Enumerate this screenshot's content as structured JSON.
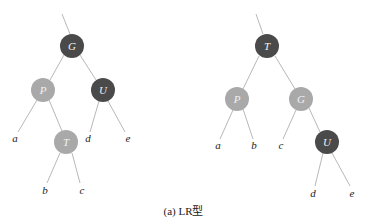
{
  "caption": "(a) LR型",
  "colors": {
    "black_node": "#4a4a4a",
    "red_node": "#a9a9a9",
    "edge": "#b8b8b8",
    "leaf_text": "#222222"
  },
  "left_tree": {
    "title": "before rotation",
    "nodes": [
      {
        "id": "G",
        "label": "G",
        "color": "black",
        "x": 72,
        "y": 46
      },
      {
        "id": "P",
        "label": "P",
        "color": "red",
        "x": 43,
        "y": 90
      },
      {
        "id": "U",
        "label": "U",
        "color": "black",
        "x": 103,
        "y": 90
      },
      {
        "id": "T",
        "label": "T",
        "color": "red",
        "x": 66,
        "y": 142
      }
    ],
    "leaves": [
      {
        "label": "a",
        "x": 15,
        "y": 138
      },
      {
        "label": "d",
        "x": 88,
        "y": 138
      },
      {
        "label": "e",
        "x": 128,
        "y": 138
      },
      {
        "label": "b",
        "x": 45,
        "y": 190
      },
      {
        "label": "c",
        "x": 82,
        "y": 190
      }
    ]
  },
  "right_tree": {
    "title": "after rotation",
    "nodes": [
      {
        "id": "T",
        "label": "T",
        "color": "black",
        "x": 267,
        "y": 46
      },
      {
        "id": "P",
        "label": "P",
        "color": "red",
        "x": 237,
        "y": 99
      },
      {
        "id": "G",
        "label": "G",
        "color": "red",
        "x": 301,
        "y": 99
      },
      {
        "id": "U",
        "label": "U",
        "color": "black",
        "x": 327,
        "y": 142
      }
    ],
    "leaves": [
      {
        "label": "a",
        "x": 218,
        "y": 145
      },
      {
        "label": "b",
        "x": 254,
        "y": 145
      },
      {
        "label": "c",
        "x": 281,
        "y": 145
      },
      {
        "label": "d",
        "x": 313,
        "y": 193
      },
      {
        "label": "e",
        "x": 352,
        "y": 193
      }
    ]
  }
}
